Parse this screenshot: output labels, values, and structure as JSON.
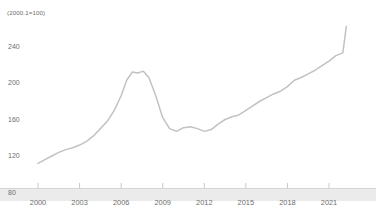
{
  "chart_data": {
    "type": "line",
    "title": "",
    "subtitle": "",
    "unit_note": "(2000.1=100)",
    "xlabel": "",
    "ylabel": "",
    "grid": false,
    "legend": "none",
    "xlim": [
      2000.0,
      2022.25
    ],
    "ylim": [
      80,
      270
    ],
    "y_ticks": [
      80,
      120,
      160,
      200,
      240
    ],
    "x_ticks": [
      2000,
      2003,
      2006,
      2009,
      2012,
      2015,
      2018,
      2021
    ],
    "line_color": "#c2c2c2",
    "axis_band_color": "#ebebeb",
    "text_color": "#6e6e6e",
    "series": [
      {
        "name": "Index",
        "x": [
          2000.0,
          2000.5,
          2001.0,
          2001.5,
          2002.0,
          2002.5,
          2003.0,
          2003.5,
          2004.0,
          2004.5,
          2005.0,
          2005.5,
          2006.0,
          2006.4,
          2006.8,
          2007.2,
          2007.6,
          2008.0,
          2008.5,
          2009.0,
          2009.5,
          2010.0,
          2010.5,
          2011.0,
          2011.5,
          2012.0,
          2012.5,
          2013.0,
          2013.5,
          2014.0,
          2014.5,
          2015.0,
          2015.5,
          2016.0,
          2016.5,
          2017.0,
          2017.5,
          2018.0,
          2018.5,
          2019.0,
          2019.5,
          2020.0,
          2020.5,
          2021.0,
          2021.5,
          2022.0,
          2022.25
        ],
        "values": [
          112,
          116,
          120,
          124,
          127,
          129,
          132,
          136,
          142,
          150,
          158,
          170,
          186,
          203,
          212,
          211,
          213,
          206,
          186,
          162,
          150,
          147,
          151,
          152,
          150,
          147,
          149,
          155,
          160,
          163,
          165,
          170,
          175,
          180,
          184,
          188,
          191,
          196,
          203,
          206,
          210,
          214,
          219,
          224,
          230,
          233,
          262
        ]
      }
    ]
  }
}
